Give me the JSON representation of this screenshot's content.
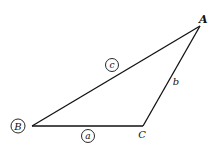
{
  "diagram": {
    "type": "triangle",
    "vertices": {
      "A": {
        "label": "A",
        "circled": false
      },
      "B": {
        "label": "B",
        "circled": true
      },
      "C": {
        "label": "C",
        "circled": false
      }
    },
    "sides": {
      "a": {
        "label": "a",
        "circled": true,
        "between": "B-C"
      },
      "b": {
        "label": "b",
        "circled": false,
        "between": "C-A"
      },
      "c": {
        "label": "c",
        "circled": true,
        "between": "B-A"
      }
    },
    "colors": {
      "stroke": "#111111",
      "background": "#ffffff"
    }
  }
}
